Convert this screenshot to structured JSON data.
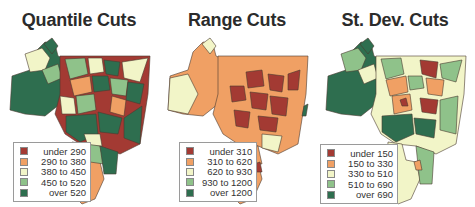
{
  "palette": {
    "class1": "#a33a33",
    "class2": "#f0a064",
    "class3": "#f2f5c8",
    "class4": "#8fc28a",
    "class5": "#2e6e4f",
    "outline": "#4a3a30"
  },
  "panels": [
    {
      "title": "Quantile Cuts",
      "legend": [
        {
          "label": "under 290",
          "color": "#a33a33"
        },
        {
          "label": "290 to 380",
          "color": "#f0a064"
        },
        {
          "label": "380 to 450",
          "color": "#f2f5c8"
        },
        {
          "label": "450 to 520",
          "color": "#8fc28a"
        },
        {
          "label": "over 520",
          "color": "#2e6e4f"
        }
      ]
    },
    {
      "title": "Range Cuts",
      "legend": [
        {
          "label": "under 310",
          "color": "#a33a33"
        },
        {
          "label": "310 to 620",
          "color": "#f0a064"
        },
        {
          "label": "620 to 930",
          "color": "#f2f5c8"
        },
        {
          "label": "930 to 1200",
          "color": "#8fc28a"
        },
        {
          "label": "over 1200",
          "color": "#2e6e4f"
        }
      ]
    },
    {
      "title": "St. Dev. Cuts",
      "legend": [
        {
          "label": "under 150",
          "color": "#a33a33"
        },
        {
          "label": "150 to 330",
          "color": "#f0a064"
        },
        {
          "label": "330 to 510",
          "color": "#f2f5c8"
        },
        {
          "label": "510 to 690",
          "color": "#8fc28a"
        },
        {
          "label": "over 690",
          "color": "#2e6e4f"
        }
      ]
    }
  ]
}
